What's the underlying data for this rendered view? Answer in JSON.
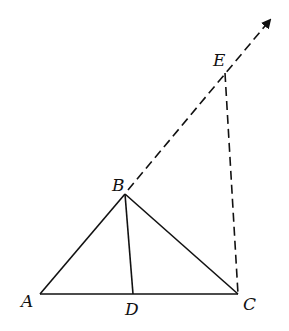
{
  "diagram": {
    "type": "geometry",
    "points": {
      "A": {
        "label": "A",
        "x": 40,
        "y": 294
      },
      "B": {
        "label": "B",
        "x": 125,
        "y": 194
      },
      "C": {
        "label": "C",
        "x": 238,
        "y": 294
      },
      "D": {
        "label": "D",
        "x": 133,
        "y": 294
      },
      "E": {
        "label": "E",
        "x": 225,
        "y": 73
      }
    },
    "segments": [
      {
        "from": "A",
        "to": "B",
        "style": "solid"
      },
      {
        "from": "B",
        "to": "C",
        "style": "solid"
      },
      {
        "from": "A",
        "to": "C",
        "style": "solid"
      },
      {
        "from": "B",
        "to": "D",
        "style": "solid"
      },
      {
        "from": "B",
        "to": "E",
        "style": "dashed",
        "note": "extension of AB as ray"
      },
      {
        "from": "E",
        "to": "C",
        "style": "dashed"
      }
    ],
    "ray_arrow": {
      "from": "B",
      "direction": "through E",
      "style": "dashed"
    },
    "colors": {
      "stroke": "#111111",
      "background": "#ffffff"
    }
  }
}
